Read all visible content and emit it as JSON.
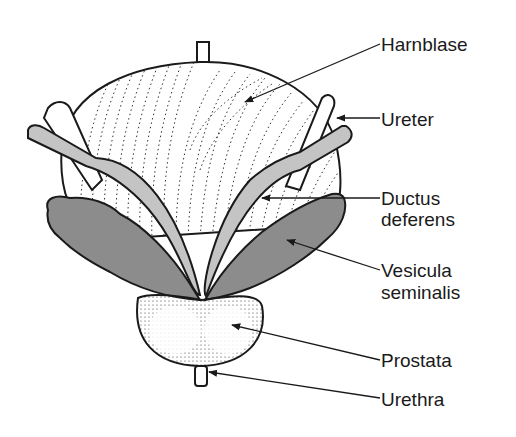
{
  "diagram": {
    "labels": [
      {
        "id": "harnblase",
        "text": "Harnblase",
        "x": 381,
        "y": 34
      },
      {
        "id": "ureter",
        "text": "Ureter",
        "x": 381,
        "y": 109
      },
      {
        "id": "ductus",
        "text": "Ductus",
        "x": 381,
        "y": 188
      },
      {
        "id": "deferens",
        "text": "deferens",
        "x": 381,
        "y": 209
      },
      {
        "id": "vesicula",
        "text": "Vesicula",
        "x": 381,
        "y": 260
      },
      {
        "id": "seminalis",
        "text": "seminalis",
        "x": 381,
        "y": 282
      },
      {
        "id": "prostata",
        "text": "Prostata",
        "x": 381,
        "y": 350
      },
      {
        "id": "urethra",
        "text": "Urethra",
        "x": 381,
        "y": 389
      }
    ],
    "colors": {
      "outline": "#1a1a1a",
      "vesicula_fill": "#8c8c8c",
      "ductus_fill": "#c4c4c4",
      "ureter_fill": "#ffffff",
      "background": "#ffffff"
    }
  }
}
